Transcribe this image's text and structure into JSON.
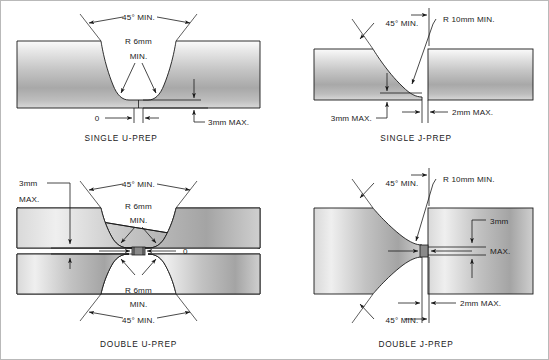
{
  "page": {
    "background_color": "#ffffff",
    "line_color": "#1a1a1a",
    "metal_light": "#f2f2f2",
    "metal_mid": "#b4b4b4",
    "metal_dark": "#8c8c8c"
  },
  "figures": [
    {
      "id": "single-u-prep",
      "caption": "SINGLE U-PREP",
      "labels": {
        "angle": "45° MIN.",
        "radius_line1": "R 6mm",
        "radius_line2": "MIN.",
        "root_gap": "0",
        "root_face": "3mm MAX."
      }
    },
    {
      "id": "single-j-prep",
      "caption": "SINGLE J-PREP",
      "labels": {
        "angle": "45° MIN.",
        "radius": "R 10mm MIN.",
        "root_face": "3mm MAX.",
        "root_gap": "2mm MAX."
      }
    },
    {
      "id": "double-u-prep",
      "caption": "DOUBLE U-PREP",
      "labels": {
        "angle_top": "45° MIN.",
        "angle_bottom": "45° MIN.",
        "radius_top_line1": "R 6mm",
        "radius_top_line2": "MIN.",
        "radius_bottom_line1": "R 6mm",
        "radius_bottom_line2": "MIN.",
        "root_face_line1": "3mm",
        "root_face_line2": "MAX.",
        "root_gap": "0"
      }
    },
    {
      "id": "double-j-prep",
      "caption": "DOUBLE J-PREP",
      "labels": {
        "angle_top": "45° MIN.",
        "angle_bottom": "45° MIN.",
        "radius": "R 10mm MIN.",
        "root_face_line1": "3mm",
        "root_face_line2": "MAX.",
        "root_gap": "2mm MAX."
      }
    }
  ]
}
